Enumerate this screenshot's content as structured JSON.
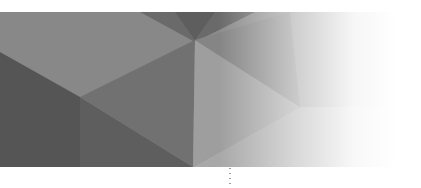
{
  "banner": {
    "description": "Gray low-poly geometric background banner fading to white on the right",
    "colors": {
      "base": "#8a8a8a",
      "dark": "#5c5c5c",
      "darker": "#4f4f4f",
      "mid": "#7a7a7a",
      "light": "#a4a4a4",
      "fade_to": "#ffffff"
    }
  },
  "connector": {
    "style": "dotted",
    "color": "#9a9a9a"
  }
}
